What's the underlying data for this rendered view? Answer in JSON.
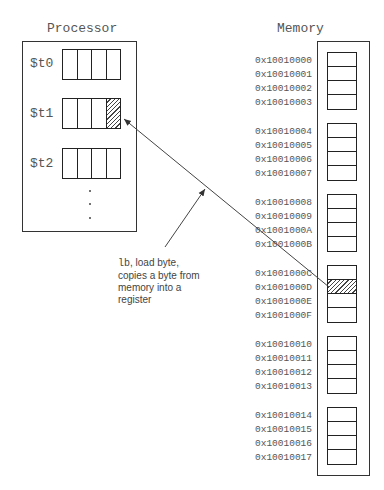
{
  "processor": {
    "title": "Processor",
    "registers": [
      {
        "name": "$t0",
        "highlighted_byte": null
      },
      {
        "name": "$t1",
        "highlighted_byte": 3
      },
      {
        "name": "$t2",
        "highlighted_byte": null
      }
    ],
    "ellipsis": "⋮"
  },
  "memory": {
    "title": "Memory",
    "words": [
      {
        "addresses": [
          "0x10010000",
          "0x10010001",
          "0x10010002",
          "0x10010003"
        ]
      },
      {
        "addresses": [
          "0x10010004",
          "0x10010005",
          "0x10010006",
          "0x10010007"
        ]
      },
      {
        "addresses": [
          "0x10010008",
          "0x10010009",
          "0x1001000A",
          "0x1001000B"
        ]
      },
      {
        "addresses": [
          "0x1001000C",
          "0x1001000D",
          "0x1001000E",
          "0x1001000F"
        ],
        "highlighted_byte": 1
      },
      {
        "addresses": [
          "0x10010010",
          "0x10010011",
          "0x10010012",
          "0x10010013"
        ]
      },
      {
        "addresses": [
          "0x10010014",
          "0x10010015",
          "0x10010016",
          "0x10010017"
        ]
      }
    ]
  },
  "annotation": {
    "instruction": "lb",
    "text_line1": ", load byte,",
    "text_line2": "copies a byte from",
    "text_line3": "memory into a",
    "text_line4": "register"
  },
  "colors": {
    "line": "#333333",
    "text": "#555555"
  }
}
